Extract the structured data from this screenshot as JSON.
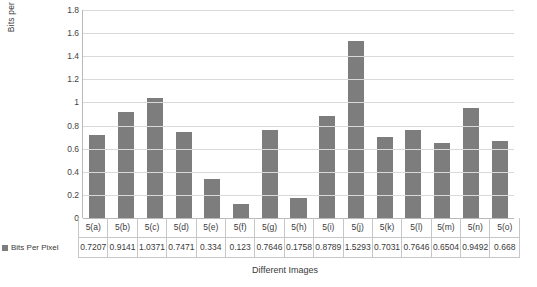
{
  "chart_data": {
    "type": "bar",
    "title": "",
    "xlabel": "Different Images",
    "ylabel": "Bits per pixel Values",
    "ylim": [
      0,
      1.8
    ],
    "ytick_step": 0.2,
    "grid": true,
    "legend_position": "bottom-table",
    "series_name": "Bits Per Pixel",
    "bar_color": "#7d7d7d",
    "categories": [
      "5(a)",
      "5(b)",
      "5(c)",
      "5(d)",
      "5(e)",
      "5(f)",
      "5(g)",
      "5(h)",
      "5(i)",
      "5(j)",
      "5(k)",
      "5(l)",
      "5(m)",
      "5(n)",
      "5(o)"
    ],
    "values": [
      0.7207,
      0.9141,
      1.0371,
      0.7471,
      0.334,
      0.123,
      0.7646,
      0.1758,
      0.8789,
      1.5293,
      0.7031,
      0.7646,
      0.6504,
      0.9492,
      0.668
    ],
    "value_labels": [
      "0.7207",
      "0.9141",
      "1.0371",
      "0.7471",
      "0.334",
      "0.123",
      "0.7646",
      "0.1758",
      "0.8789",
      "1.5293",
      "0.7031",
      "0.7646",
      "0.6504",
      "0.9492",
      "0.668"
    ],
    "ytick_labels": [
      "0",
      "0.2",
      "0.4",
      "0.6",
      "0.8",
      "1",
      "1.2",
      "1.4",
      "1.6",
      "1.8"
    ]
  }
}
